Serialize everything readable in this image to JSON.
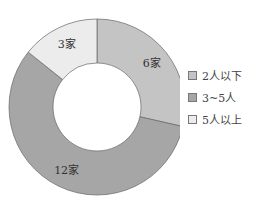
{
  "chart_data": {
    "type": "pie",
    "donut": true,
    "title": "",
    "categories": [
      "2人以下",
      "3~5人",
      "5人以上"
    ],
    "values": [
      6,
      12,
      3
    ],
    "labels": [
      "6家",
      "12家",
      "3家"
    ],
    "colors": [
      "#c4c4c4",
      "#a6a6a6",
      "#ececec"
    ],
    "legend_position": "right"
  },
  "legend": [
    {
      "label": "2人以下",
      "color": "#c4c4c4"
    },
    {
      "label": "3~5人",
      "color": "#a6a6a6"
    },
    {
      "label": "5人以上",
      "color": "#ececec"
    }
  ]
}
